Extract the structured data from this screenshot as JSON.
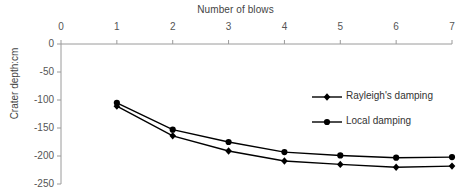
{
  "chart_data": {
    "type": "line",
    "title": "Number of blows",
    "xlabel": "Number of blows",
    "ylabel": "Crater depth:cm",
    "x": [
      1,
      2,
      3,
      4,
      5,
      6,
      7
    ],
    "xlim": [
      0,
      7
    ],
    "ylim": [
      -250,
      0
    ],
    "xticks": [
      "0",
      "1",
      "2",
      "3",
      "4",
      "5",
      "6",
      "7"
    ],
    "yticks": [
      "0",
      "-50",
      "-100",
      "-150",
      "-200",
      "-250"
    ],
    "xticks_values": [
      0,
      1,
      2,
      3,
      4,
      5,
      6,
      7
    ],
    "yticks_values": [
      0,
      -50,
      -100,
      -150,
      -200,
      -250
    ],
    "x_axis_position": "top",
    "grid": false,
    "legend_position": "inside-right",
    "series": [
      {
        "name": "Rayleigh's damping",
        "marker": "diamond",
        "color": "#000000",
        "values": [
          -111,
          -164,
          -191,
          -209,
          -215,
          -220,
          -218
        ]
      },
      {
        "name": "Local damping",
        "marker": "circle",
        "color": "#000000",
        "values": [
          -105,
          -153,
          -175,
          -193,
          -199,
          -203,
          -202
        ]
      }
    ]
  },
  "legend": {
    "items": [
      {
        "label": "Rayleigh's damping",
        "marker": "diamond"
      },
      {
        "label": "Local damping",
        "marker": "circle"
      }
    ]
  },
  "colors": {
    "axis": "#9a9a9a",
    "series": "#000000",
    "text": "#444444"
  }
}
